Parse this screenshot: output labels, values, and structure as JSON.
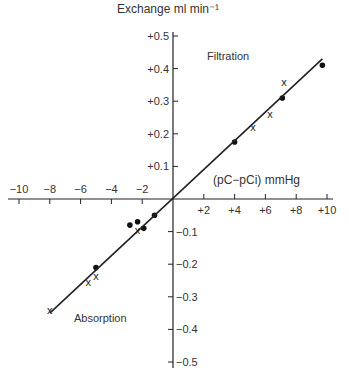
{
  "chart_data": {
    "type": "scatter",
    "title": "",
    "ylabel": "Exchange ml min⁻¹",
    "xlabel": "(pC−pCi) mmHg",
    "xlim": [
      -10,
      10
    ],
    "ylim": [
      -0.5,
      0.5
    ],
    "x_ticks": [
      "−10",
      "−8",
      "−6",
      "−4",
      "−2",
      "+2",
      "+4",
      "+6",
      "+8",
      "+10"
    ],
    "y_ticks": [
      "+0.5",
      "+0.4",
      "+0.3",
      "+0.2",
      "+0.1",
      "−0.1",
      "−0.2",
      "−0.3",
      "−0.4",
      "−0.5"
    ],
    "annotations": [
      "Filtration",
      "Absorption"
    ],
    "grid": false,
    "series": [
      {
        "name": "dots",
        "marker": "circle",
        "x": [
          4.0,
          7.1,
          9.7,
          -1.2,
          -2.8,
          -2.3,
          -1.9,
          -5.0
        ],
        "y": [
          0.175,
          0.31,
          0.41,
          -0.05,
          -0.08,
          -0.07,
          -0.09,
          -0.21
        ]
      },
      {
        "name": "crosses",
        "marker": "x",
        "x": [
          5.2,
          6.3,
          7.2,
          -2.3,
          -5.0,
          -5.5,
          -8.0
        ],
        "y": [
          0.22,
          0.26,
          0.36,
          -0.095,
          -0.235,
          -0.255,
          -0.34
        ]
      },
      {
        "name": "fit line",
        "type": "line",
        "x": [
          -8.0,
          9.7
        ],
        "y": [
          -0.35,
          0.43
        ]
      }
    ]
  }
}
